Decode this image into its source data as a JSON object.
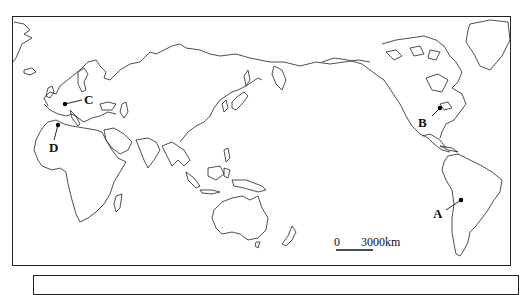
{
  "map": {
    "type": "world outline map, Pacific-centered",
    "points": [
      {
        "id": "A",
        "label": "A",
        "region": "South America (central Andes / Bolivia area)"
      },
      {
        "id": "B",
        "label": "B",
        "region": "North America (Great Lakes area)"
      },
      {
        "id": "C",
        "label": "C",
        "region": "Western Europe (France)"
      },
      {
        "id": "D",
        "label": "D",
        "region": "North Africa (Morocco/Algeria coast)"
      }
    ],
    "scale_bar": {
      "zero_label": "0",
      "distance_label": "3000km"
    },
    "colors": {
      "line": "#222222",
      "background": "#ffffff",
      "point": "#000000"
    }
  }
}
